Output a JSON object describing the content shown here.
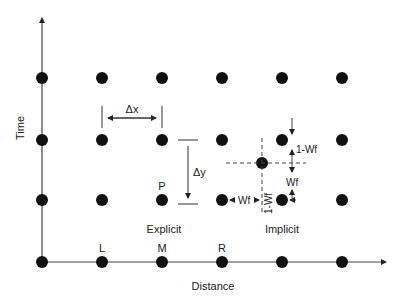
{
  "axes": {
    "x_label": "Distance",
    "y_label": "Time"
  },
  "grid": {
    "columns_x": [
      42,
      102,
      162,
      222,
      282,
      342
    ],
    "rows_y": [
      78,
      140,
      200,
      262
    ]
  },
  "labels": {
    "delta_x": "Δx",
    "delta_y": "Δy",
    "point_p": "P",
    "point_l": "L",
    "point_m": "M",
    "point_r": "R",
    "explicit": "Explicit",
    "implicit": "Implicit",
    "wf_horizontal": "Wf",
    "one_minus_wf_vertical": "1-Wf",
    "one_minus_wf_right": "1-Wf",
    "wf_right": "Wf"
  },
  "colors": {
    "dot": "#111111",
    "line": "#333333"
  }
}
